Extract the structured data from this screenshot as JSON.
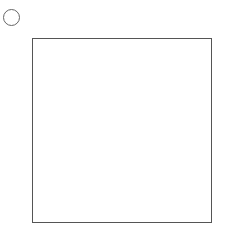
{
  "puzzle": {
    "label": " い",
    "grid": {
      "rows": 7,
      "cols": 7
    },
    "top_clues": [
      "white",
      "black",
      "white",
      "black",
      "white",
      "black",
      "black",
      "black"
    ],
    "right_clues": [
      "white",
      "white",
      "white",
      "white",
      "white",
      "white",
      "black"
    ]
  },
  "colors": {
    "black_stone": "#2b2b2b",
    "white_stone_border": "#555555",
    "grid_line": "#666666"
  }
}
